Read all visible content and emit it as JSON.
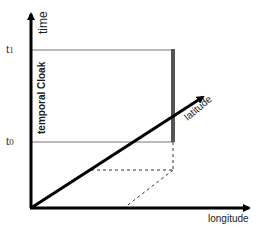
{
  "diagram": {
    "axes": {
      "time": {
        "label": "time"
      },
      "longitude": {
        "label": "longitude"
      },
      "latitude": {
        "label": "latitude"
      }
    },
    "ticks": {
      "t1": "t1",
      "t0": "t0"
    },
    "region_label": "temporal Cloak",
    "colors": {
      "axis": "#000000",
      "guide": "#777777",
      "cloak_bar": "#555555",
      "dashed": "#333333"
    }
  }
}
